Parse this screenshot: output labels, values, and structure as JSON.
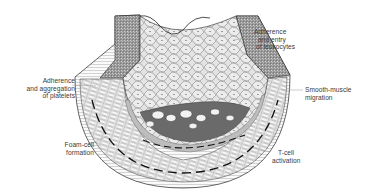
{
  "diagram": {
    "labels": [
      {
        "id": "leukocytes",
        "lines": [
          "Adherence",
          "and entry",
          "of leukocytes"
        ]
      },
      {
        "id": "platelets",
        "lines": [
          "Adherence",
          "and aggregation",
          "of platelets"
        ]
      },
      {
        "id": "smooth-muscle",
        "lines": [
          "Smooth-muscle",
          "migration"
        ]
      },
      {
        "id": "foam-cell",
        "lines": [
          "Foam-cell",
          "formation"
        ]
      },
      {
        "id": "t-cell",
        "lines": [
          "T-cell",
          "activation"
        ]
      }
    ],
    "colors": {
      "background": "#ffffff",
      "ink": "#2a2a2a",
      "lumen": "#d9d9d9",
      "plaque": "#6a6a6a",
      "intima_band": "#bdbdbd",
      "label_text": "#3a3a3a",
      "leader_line": "#9a9a9a"
    }
  }
}
